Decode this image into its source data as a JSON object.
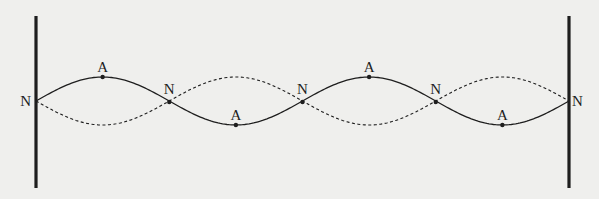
{
  "diagram": {
    "harmonic_segments": 4,
    "colors": {
      "background": "#efefed",
      "ink": "#1e1e1e"
    },
    "walls": [
      {
        "id": "left-wall",
        "side": "left"
      },
      {
        "id": "right-wall",
        "side": "right"
      }
    ],
    "nodes": [
      {
        "label": "N",
        "index": 0,
        "label_side": "left"
      },
      {
        "label": "N",
        "index": 1,
        "label_side": "above"
      },
      {
        "label": "N",
        "index": 2,
        "label_side": "above"
      },
      {
        "label": "N",
        "index": 3,
        "label_side": "above"
      },
      {
        "label": "N",
        "index": 4,
        "label_side": "right"
      }
    ],
    "antinodes": [
      {
        "label": "A",
        "segment": 0,
        "position": "crest"
      },
      {
        "label": "A",
        "segment": 1,
        "position": "trough"
      },
      {
        "label": "A",
        "segment": 2,
        "position": "crest"
      },
      {
        "label": "A",
        "segment": 3,
        "position": "trough"
      }
    ],
    "curves": [
      {
        "name": "solid-waveform",
        "style": "solid",
        "phase": 1
      },
      {
        "name": "dashed-waveform",
        "style": "dashed",
        "phase": -1
      }
    ]
  }
}
